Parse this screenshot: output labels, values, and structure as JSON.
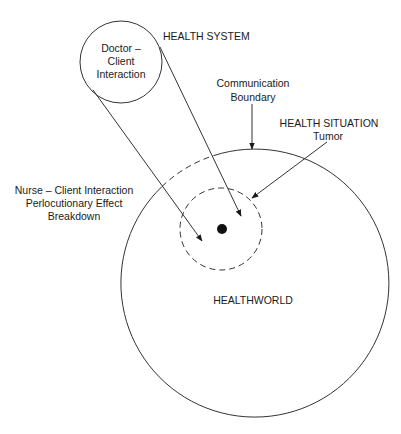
{
  "diagram": {
    "labels": {
      "doctor_circle": {
        "line1": "Doctor –",
        "line2": "Client",
        "line3": "Interaction"
      },
      "health_system": "HEALTH SYSTEM",
      "communication_boundary": {
        "line1": "Communication",
        "line2": "Boundary"
      },
      "health_situation": {
        "line1": "HEALTH SITUATION",
        "line2": "Tumor"
      },
      "nurse": {
        "line1": "Nurse – Client Interaction",
        "line2": "Perlocutionary Effect",
        "line3": "Breakdown"
      },
      "healthworld": "HEALTHWORLD"
    },
    "shapes": {
      "doctor_circle": {
        "cx": 121,
        "cy": 62,
        "r": 41,
        "style": "solid"
      },
      "healthworld_circle": {
        "cx": 255,
        "cy": 283,
        "r": 134,
        "style": "solid with dashed upper-left segment"
      },
      "health_situation_circle": {
        "cx": 221,
        "cy": 229,
        "r": 41,
        "style": "dashed"
      },
      "tumor_dot": {
        "cx": 222,
        "cy": 229,
        "r": 5
      }
    },
    "colors": {
      "line": "#333333",
      "text": "#1a1a1a",
      "background": "#ffffff"
    }
  }
}
